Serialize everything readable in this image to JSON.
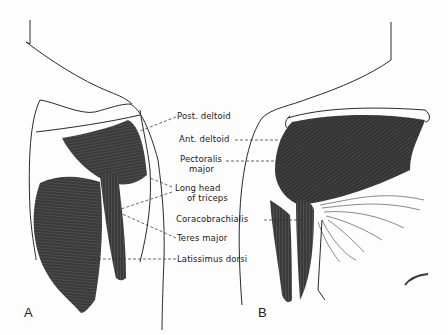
{
  "figure": {
    "panels": [
      {
        "id": "A",
        "label": "A"
      },
      {
        "id": "B",
        "label": "B"
      }
    ],
    "labels": {
      "post_deltoid": "Post. deltoid",
      "ant_deltoid": "Ant. deltoid",
      "pectoralis_1": "Pectoralis",
      "pectoralis_2": "major",
      "triceps_1": "Long head",
      "triceps_2": "of triceps",
      "coracobrachialis": "Coracobrachialis",
      "teres_major": "Teres major",
      "latissimus_dorsi": "Latissimus dorsi"
    },
    "colors": {
      "muscle": "#3a3a3a",
      "outline": "#2a2a2a",
      "background": "#fdfdfd"
    }
  }
}
